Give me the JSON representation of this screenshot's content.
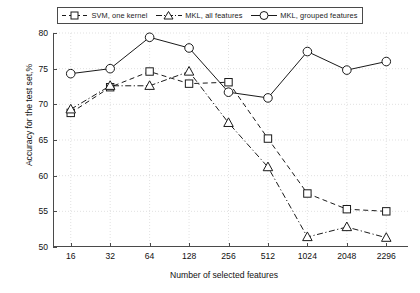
{
  "chart_data": {
    "type": "line",
    "title": "",
    "xlabel": "Number of selected features",
    "ylabel": "Accuracy for the test set,%",
    "categories": [
      "16",
      "32",
      "64",
      "128",
      "256",
      "512",
      "1024",
      "2048",
      "2296"
    ],
    "ylim": [
      50,
      80
    ],
    "yticks": [
      50,
      55,
      60,
      65,
      70,
      75,
      80
    ],
    "grid": true,
    "legend_position": "top",
    "series": [
      {
        "name": "SVM, one kernel",
        "marker": "square",
        "line_style": "dashed",
        "color": "#1a1a1a",
        "values": [
          68.8,
          72.4,
          74.6,
          72.9,
          73.1,
          65.2,
          57.5,
          55.3,
          55.0
        ]
      },
      {
        "name": "MKL, all features",
        "marker": "triangle",
        "line_style": "dash-dot",
        "color": "#1a1a1a",
        "values": [
          69.3,
          72.6,
          72.6,
          74.6,
          67.4,
          61.2,
          51.4,
          52.8,
          51.3
        ]
      },
      {
        "name": "MKL, grouped features",
        "marker": "circle",
        "line_style": "solid",
        "color": "#1a1a1a",
        "values": [
          74.3,
          75.0,
          79.4,
          77.9,
          71.7,
          70.9,
          77.4,
          74.8,
          76.0
        ]
      }
    ]
  },
  "axes": {
    "ylabel_text": "Accuracy for the test set,%",
    "xlabel_text": "Number of selected features"
  }
}
